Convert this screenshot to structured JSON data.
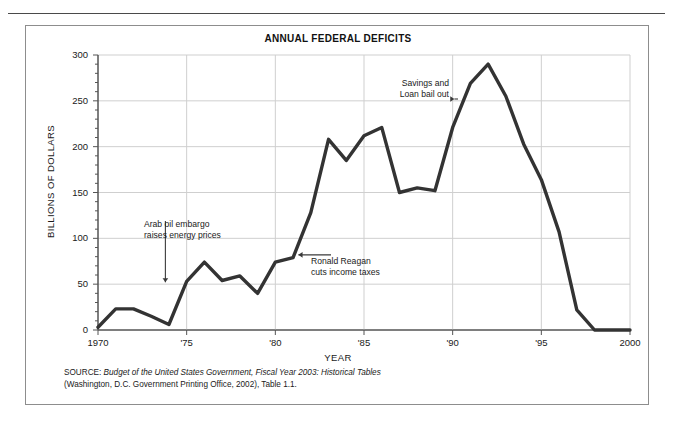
{
  "figure": {
    "title": "ANNUAL FEDERAL DEFICITS",
    "source_prefix": "SOURCE: ",
    "source_italic": "Budget of the United States Government, Fiscal Year 2003: Historical Tables",
    "source_line2": "(Washington, D.C. Government Printing Office, 2002), Table 1.1.",
    "line_color": "#333333",
    "grid_color": "#cfcfcf",
    "axis_color": "#555555",
    "border_color": "#8d8d8d"
  },
  "annotations": {
    "arab_oil": {
      "line1": "Arab oil embargo",
      "line2": "raises energy prices"
    },
    "reagan": {
      "line1": "Ronald Reagan",
      "line2": "cuts income taxes"
    },
    "savings_loan": {
      "line1": "Savings and",
      "line2": "Loan bail out"
    }
  },
  "chart_data": {
    "type": "line",
    "title": "ANNUAL FEDERAL DEFICITS",
    "xlabel": "YEAR",
    "ylabel": "BILLIONS OF DOLLARS",
    "xlim": [
      1970,
      2000
    ],
    "ylim": [
      0,
      300
    ],
    "grid": true,
    "legend": "none",
    "x_tick_labels": [
      "1970",
      "'75",
      "'80",
      "'85",
      "'90",
      "'95",
      "2000"
    ],
    "x_tick_values": [
      1970,
      1975,
      1980,
      1985,
      1990,
      1995,
      2000
    ],
    "y_tick_labels": [
      "0",
      "50",
      "100",
      "150",
      "200",
      "250",
      "300"
    ],
    "y_tick_values": [
      0,
      50,
      100,
      150,
      200,
      250,
      300
    ],
    "y_minor_tick_step": 10,
    "x": [
      1970,
      1971,
      1972,
      1973,
      1974,
      1975,
      1976,
      1977,
      1978,
      1979,
      1980,
      1981,
      1982,
      1983,
      1984,
      1985,
      1986,
      1987,
      1988,
      1989,
      1990,
      1991,
      1992,
      1993,
      1994,
      1995,
      1996,
      1997,
      1998,
      1999,
      2000
    ],
    "values": [
      3,
      23,
      23,
      15,
      6,
      53,
      74,
      54,
      59,
      40,
      74,
      79,
      128,
      208,
      185,
      212,
      221,
      150,
      155,
      152,
      221,
      269,
      290,
      255,
      203,
      164,
      107,
      22,
      0,
      0,
      0
    ],
    "units": "billions of dollars",
    "annotations": [
      {
        "text": "Arab oil embargo raises energy prices",
        "points_to_year": 1974,
        "points_to_value": 50,
        "arrow": "down"
      },
      {
        "text": "Ronald Reagan cuts income taxes",
        "points_to_year": 1981,
        "points_to_value": 79,
        "arrow": "left"
      },
      {
        "text": "Savings and Loan bail out",
        "points_to_year": 1990,
        "points_to_value": 250,
        "arrow": "right"
      }
    ]
  }
}
